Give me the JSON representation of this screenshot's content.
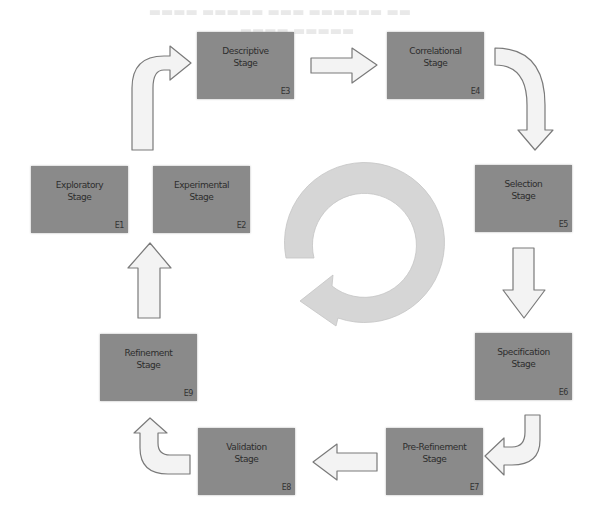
{
  "diagram": {
    "type": "cycle-flow",
    "colors": {
      "box_fill": "#8a8a8a",
      "box_text": "#2d2d2d",
      "arrow_fill": "#f3f3f3",
      "arrow_stroke": "#7a7a7a",
      "cycle_fill": "#d6d6d6"
    },
    "stages": [
      {
        "id": "E1",
        "line1": "Exploratory",
        "line2": "Stage",
        "code": "E1"
      },
      {
        "id": "E2",
        "line1": "Experimental",
        "line2": "Stage",
        "code": "E2"
      },
      {
        "id": "E3",
        "line1": "Descriptive",
        "line2": "Stage",
        "code": "E3"
      },
      {
        "id": "E4",
        "line1": "Correlational",
        "line2": "Stage",
        "code": "E4"
      },
      {
        "id": "E5",
        "line1": "Selection",
        "line2": "Stage",
        "code": "E5"
      },
      {
        "id": "E6",
        "line1": "Specification",
        "line2": "Stage",
        "code": "E6"
      },
      {
        "id": "E7",
        "line1": "Pre-Refinement",
        "line2": "Stage",
        "code": "E7"
      },
      {
        "id": "E8",
        "line1": "Validation",
        "line2": "Stage",
        "code": "E8"
      },
      {
        "id": "E9",
        "line1": "Refinement",
        "line2": "Stage",
        "code": "E9"
      }
    ],
    "flow": [
      {
        "from": "E2",
        "to": "E3",
        "shape": "bent-up-right"
      },
      {
        "from": "E3",
        "to": "E4",
        "shape": "straight-right"
      },
      {
        "from": "E4",
        "to": "E5",
        "shape": "curved-right-down"
      },
      {
        "from": "E5",
        "to": "E6",
        "shape": "straight-down"
      },
      {
        "from": "E6",
        "to": "E7",
        "shape": "hook-down-left"
      },
      {
        "from": "E7",
        "to": "E8",
        "shape": "straight-left"
      },
      {
        "from": "E8",
        "to": "E9",
        "shape": "hook-left-up"
      },
      {
        "from": "E9",
        "to": "E2",
        "shape": "straight-up"
      }
    ],
    "center_icon": "circular-cycle-arrow"
  }
}
